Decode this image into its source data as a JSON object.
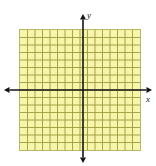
{
  "figure": {
    "name": "coordinate-plane-grid",
    "background_color": "#ffffff",
    "width": 156,
    "height": 166
  },
  "grid": {
    "fill_color": "#f6f5a9",
    "line_color": "#9a9a3c",
    "border_color": "#b8b86a",
    "columns": 16,
    "rows": 16,
    "cell_size_px": 7.625,
    "left_px": 19,
    "top_px": 29,
    "width_px": 122,
    "height_px": 122
  },
  "axes": {
    "color": "#141414",
    "stroke_width": 1.6,
    "origin": {
      "x_px": 83,
      "y_px": 90
    },
    "x_axis": {
      "label": "x",
      "start_px": 4,
      "end_px": 152,
      "arrow_start": true,
      "arrow_end": true
    },
    "y_axis": {
      "label": "y",
      "start_px": 14,
      "end_px": 163,
      "arrow_start": true,
      "arrow_end": true
    }
  },
  "chart_data": {
    "type": "scatter",
    "title": "",
    "xlabel": "x",
    "ylabel": "y",
    "x": [],
    "y": [],
    "series": [],
    "annotations": [],
    "legend": null,
    "grid": true,
    "xlim": [
      -8,
      8
    ],
    "ylim": [
      -8,
      8
    ],
    "xticks": [
      -8,
      -7,
      -6,
      -5,
      -4,
      -3,
      -2,
      -1,
      0,
      1,
      2,
      3,
      4,
      5,
      6,
      7,
      8
    ],
    "yticks": [
      -8,
      -7,
      -6,
      -5,
      -4,
      -3,
      -2,
      -1,
      0,
      1,
      2,
      3,
      4,
      5,
      6,
      7,
      8
    ],
    "xticklabels": [],
    "yticklabels": []
  }
}
